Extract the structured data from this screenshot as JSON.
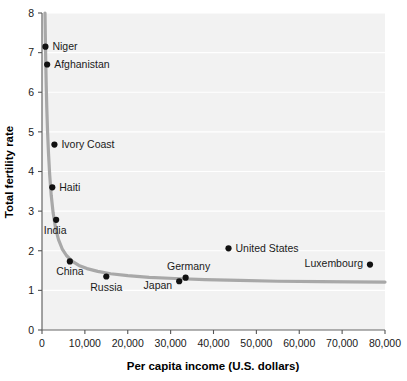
{
  "chart_data": {
    "type": "scatter",
    "title": "",
    "xlabel": "Per capita income (U.S. dollars)",
    "ylabel": "Total fertility rate",
    "xlim": [
      0,
      80000
    ],
    "ylim": [
      0,
      8
    ],
    "grid": true,
    "legend": "none",
    "xticks": [
      "0",
      "10,000",
      "20,000",
      "30,000",
      "40,000",
      "50,000",
      "60,000",
      "70,000",
      "80,000"
    ],
    "xtick_values": [
      0,
      10000,
      20000,
      30000,
      40000,
      50000,
      60000,
      70000,
      80000
    ],
    "yticks": [
      "0",
      "1",
      "2",
      "3",
      "4",
      "5",
      "6",
      "7",
      "8"
    ],
    "ytick_values": [
      0,
      1,
      2,
      3,
      4,
      5,
      6,
      7,
      8
    ],
    "points": [
      {
        "label": "Niger",
        "x": 800,
        "y": 7.15,
        "label_pos": "right"
      },
      {
        "label": "Afghanistan",
        "x": 1200,
        "y": 6.7,
        "label_pos": "right"
      },
      {
        "label": "Ivory Coast",
        "x": 2900,
        "y": 4.68,
        "label_pos": "right"
      },
      {
        "label": "Haiti",
        "x": 2400,
        "y": 3.6,
        "label_pos": "right"
      },
      {
        "label": "India",
        "x": 3300,
        "y": 2.78,
        "label_pos": "below-left"
      },
      {
        "label": "China",
        "x": 6500,
        "y": 1.73,
        "label_pos": "below"
      },
      {
        "label": "Russia",
        "x": 15000,
        "y": 1.35,
        "label_pos": "below"
      },
      {
        "label": "Japan",
        "x": 32000,
        "y": 1.23,
        "label_pos": "left-below"
      },
      {
        "label": "Germany",
        "x": 33500,
        "y": 1.32,
        "label_pos": "above-left"
      },
      {
        "label": "United States",
        "x": 43500,
        "y": 2.06,
        "label_pos": "right"
      },
      {
        "label": "Luxembourg",
        "x": 76500,
        "y": 1.65,
        "label_pos": "left"
      }
    ],
    "trend_curve": {
      "description": "Fitted hyperbolic decay curve through the country data",
      "color": "#a8a8a8",
      "width": 3.2,
      "points": [
        [
          700,
          8.0
        ],
        [
          780,
          7.4
        ],
        [
          870,
          6.8
        ],
        [
          980,
          6.2
        ],
        [
          1120,
          5.6
        ],
        [
          1300,
          5.0
        ],
        [
          1520,
          4.45
        ],
        [
          1800,
          3.9
        ],
        [
          2150,
          3.4
        ],
        [
          2600,
          2.95
        ],
        [
          3150,
          2.58
        ],
        [
          3850,
          2.28
        ],
        [
          4700,
          2.05
        ],
        [
          5700,
          1.88
        ],
        [
          7000,
          1.74
        ],
        [
          8600,
          1.63
        ],
        [
          10500,
          1.55
        ],
        [
          13000,
          1.48
        ],
        [
          16000,
          1.42
        ],
        [
          20000,
          1.37
        ],
        [
          25000,
          1.33
        ],
        [
          31000,
          1.3
        ],
        [
          38000,
          1.27
        ],
        [
          46000,
          1.25
        ],
        [
          55000,
          1.23
        ],
        [
          65000,
          1.22
        ],
        [
          72000,
          1.215
        ],
        [
          80000,
          1.21
        ]
      ]
    }
  },
  "axes": {
    "x_title": "Per capita income (U.S. dollars)",
    "y_title": "Total fertility rate"
  }
}
